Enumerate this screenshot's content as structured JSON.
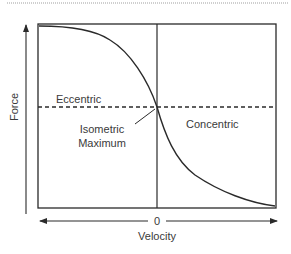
{
  "diagram": {
    "type": "force-velocity-curve",
    "axes": {
      "y_label": "Force",
      "x_label": "Velocity",
      "x_origin_label": "0"
    },
    "regions": {
      "left": "Eccentric",
      "right": "Concentric"
    },
    "annotation": {
      "line1": "Isometric",
      "line2": "Maximum"
    },
    "colors": {
      "line": "#2a2a2a",
      "text": "#3a3a3a",
      "top_rule": "#d0d0d0"
    }
  }
}
